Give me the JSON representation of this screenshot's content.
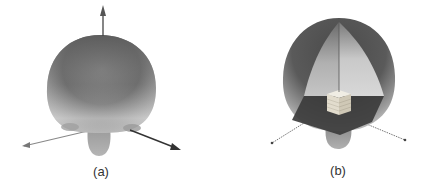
{
  "figure": {
    "panels": [
      {
        "id": "a",
        "caption": "(a)",
        "description": "3D radiation pattern of antenna, solid view",
        "colors": {
          "surface_dark": "#5a5a5a",
          "surface_light": "#bdbdbd",
          "axis": "#333333"
        }
      },
      {
        "id": "b",
        "caption": "(b)",
        "description": "3D radiation pattern with cutaway showing antenna structure inside",
        "colors": {
          "surface_dark": "#4a4a4a",
          "surface_light": "#c8c8c8",
          "interior": "#d6d6d6",
          "ground_plane": "#3c3c3c",
          "antenna_block": "#e8e4d8",
          "axis": "#444444"
        }
      }
    ]
  }
}
